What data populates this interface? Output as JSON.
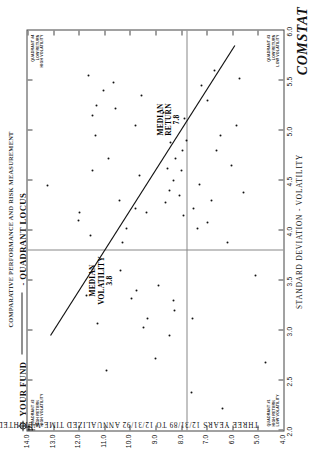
{
  "header": {
    "top_rule_text": "COMPARATIVE PERFORMANCE AND RISK MEASUREMENT",
    "legend_fund_label": "YOUR FUND",
    "legend_locus_label": "- QUADRANT LOCUS",
    "fund_marker_icon": "crosshair-circle-icon",
    "brand": "COMSTAT"
  },
  "axes": {
    "x_title": "STANDARD DEVIATION - VOLATILITY",
    "x_ticks": [
      "2.0",
      "2.5",
      "3.0",
      "3.5",
      "4.0",
      "4.5",
      "5.0",
      "5.5",
      "6.0"
    ],
    "x_min": 2.0,
    "x_max": 6.0,
    "y_title": "THREE YEARS   12/31/89   TO   12/31/92   ANNUALIZED   TIME-WEIGHTED   RATES OF RETURN",
    "y_title_parts": [
      "THREE YEARS",
      "12/31/89",
      "TO",
      "12/31/92",
      "ANNUALIZED",
      "TIME-WEIGHTED",
      "RATES OF RETURN"
    ],
    "y_ticks": [
      "4.0",
      "5.0",
      "6.0",
      "7.0",
      "8.0",
      "9.0",
      "10.0",
      "11.0",
      "12.0",
      "13.0",
      "14.0"
    ],
    "y_min": 4.0,
    "y_max": 14.0
  },
  "annotations": {
    "median_volatility_label": "MEDIAN VOLATILITY",
    "median_volatility_value": "3.8",
    "median_return_label": "MEDIAN RETURN",
    "median_return_value": "7.8"
  },
  "quadrants": [
    {
      "id": "q2",
      "number": "QUADRANT #2",
      "line1": "HIGH RETURN",
      "line2": "HIGH VOLATILITY",
      "corner": "top-left"
    },
    {
      "id": "q4",
      "number": "QUADRANT #4",
      "line1": "LOW RETURN",
      "line2": "HIGH VOLATILITY",
      "corner": "top-right"
    },
    {
      "id": "q1",
      "number": "QUADRANT #1",
      "line1": "HIGH RETURN",
      "line2": "LOW VOLATILITY",
      "corner": "bottom-left"
    },
    {
      "id": "q3",
      "number": "QUADRANT #3",
      "line1": "LOW RETURN",
      "line2": "LOW VOLATILITY",
      "corner": "bottom-right"
    }
  ],
  "chart_data": {
    "type": "scatter",
    "xlabel": "STANDARD DEVIATION - VOLATILITY",
    "ylabel": "THREE YEARS 12/31/89 TO 12/31/92 ANNUALIZED TIME-WEIGHTED RATES OF RETURN",
    "xlim": [
      2.0,
      6.0
    ],
    "ylim": [
      4.0,
      14.0
    ],
    "grid": false,
    "legend_position": "top-left",
    "median_volatility": 3.8,
    "median_return": 7.8,
    "your_fund": {
      "x": 2.0,
      "y": 14.0,
      "label": "YOUR FUND"
    },
    "locus_line": {
      "x0": 2.95,
      "y0": 13.1,
      "x1": 5.85,
      "y1": 5.9,
      "label": "QUADRANT LOCUS"
    },
    "points": [
      [
        4.45,
        13.2
      ],
      [
        3.35,
        11.7
      ],
      [
        4.1,
        12.0
      ],
      [
        4.18,
        11.95
      ],
      [
        3.95,
        11.55
      ],
      [
        4.6,
        11.45
      ],
      [
        4.95,
        11.35
      ],
      [
        5.15,
        11.45
      ],
      [
        5.25,
        11.3
      ],
      [
        5.55,
        11.6
      ],
      [
        3.07,
        11.25
      ],
      [
        5.4,
        11.05
      ],
      [
        4.72,
        10.85
      ],
      [
        5.48,
        10.65
      ],
      [
        5.22,
        10.55
      ],
      [
        3.6,
        10.35
      ],
      [
        3.88,
        10.3
      ],
      [
        4.02,
        10.15
      ],
      [
        4.3,
        10.4
      ],
      [
        2.6,
        10.9
      ],
      [
        3.32,
        9.95
      ],
      [
        3.4,
        9.75
      ],
      [
        4.22,
        9.8
      ],
      [
        4.55,
        9.62
      ],
      [
        5.05,
        9.8
      ],
      [
        5.35,
        9.55
      ],
      [
        4.18,
        9.35
      ],
      [
        3.03,
        9.45
      ],
      [
        3.12,
        9.3
      ],
      [
        2.72,
        9.0
      ],
      [
        3.45,
        8.9
      ],
      [
        5.18,
        8.7
      ],
      [
        4.62,
        8.55
      ],
      [
        4.88,
        8.4
      ],
      [
        2.95,
        8.45
      ],
      [
        3.2,
        8.25
      ],
      [
        3.3,
        8.3
      ],
      [
        4.28,
        8.6
      ],
      [
        4.4,
        8.45
      ],
      [
        4.5,
        8.3
      ],
      [
        4.72,
        8.2
      ],
      [
        4.35,
        8.05
      ],
      [
        4.6,
        8.0
      ],
      [
        4.8,
        7.95
      ],
      [
        4.15,
        7.9
      ],
      [
        4.9,
        7.8
      ],
      [
        5.12,
        7.85
      ],
      [
        2.38,
        7.6
      ],
      [
        3.12,
        7.55
      ],
      [
        4.22,
        7.5
      ],
      [
        4.02,
        7.35
      ],
      [
        4.46,
        7.3
      ],
      [
        4.08,
        6.95
      ],
      [
        4.3,
        6.8
      ],
      [
        5.45,
        7.2
      ],
      [
        5.3,
        6.95
      ],
      [
        4.8,
        6.6
      ],
      [
        2.22,
        6.4
      ],
      [
        4.95,
        6.45
      ],
      [
        5.6,
        6.7
      ],
      [
        3.88,
        6.2
      ],
      [
        4.65,
        6.05
      ],
      [
        5.05,
        5.85
      ],
      [
        5.52,
        5.7
      ],
      [
        4.38,
        5.55
      ],
      [
        3.55,
        5.1
      ],
      [
        2.68,
        4.7
      ]
    ]
  }
}
